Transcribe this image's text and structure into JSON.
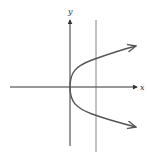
{
  "diagram": {
    "type": "parabola-graph",
    "equation_hint": "x = y^2 (opening right)",
    "axes": {
      "x_label": "x",
      "y_label": "y"
    },
    "colors": {
      "axis": "#333333",
      "curve": "#555555",
      "line": "#666666",
      "background": "#ffffff"
    },
    "elements": [
      {
        "name": "x-axis",
        "from": [
          10,
          87
        ],
        "to": [
          138,
          87
        ]
      },
      {
        "name": "y-axis",
        "from": [
          70,
          145
        ],
        "to": [
          70,
          20
        ]
      },
      {
        "name": "vertical-line",
        "x": 96,
        "from_y": 20,
        "to_y": 152
      },
      {
        "name": "parabola",
        "vertex": [
          70,
          87
        ],
        "upper_end": [
          136,
          46
        ],
        "lower_end": [
          136,
          127
        ]
      }
    ]
  }
}
